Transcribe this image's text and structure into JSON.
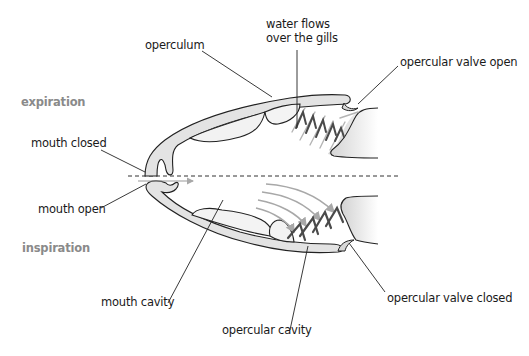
{
  "diagram": {
    "phases": {
      "expiration": "expiration",
      "inspiration": "inspiration"
    },
    "labels": {
      "operculum": "operculum",
      "water_flows": "water flows\nover the gills",
      "opercular_valve_open": "opercular valve open",
      "mouth_closed": "mouth closed",
      "mouth_open": "mouth open",
      "mouth_cavity": "mouth cavity",
      "opercular_cavity": "opercular cavity",
      "opercular_valve_closed": "opercular valve closed"
    },
    "colors": {
      "outline": "#222222",
      "fill_light": "#e6e6e6",
      "fill_lighter": "#f2f2f2",
      "arrow_gray": "#a8a8a8",
      "gill_dark": "#555555",
      "phase_text": "#8a8a8a"
    }
  }
}
